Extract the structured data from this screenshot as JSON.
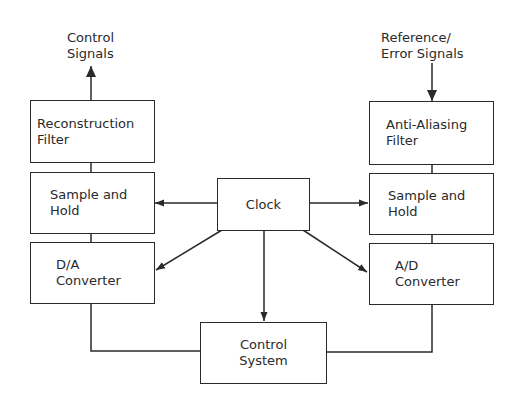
{
  "diagram": {
    "type": "block-diagram",
    "colors": {
      "line": "#2a2a2a",
      "background": "#ffffff"
    },
    "external_labels": {
      "output": {
        "line1": "Control",
        "line2": "Signals"
      },
      "input": {
        "line1": "Reference/",
        "line2": "Error Signals"
      }
    },
    "blocks": {
      "reconstruction_filter": {
        "line1": "Reconstruction",
        "line2": "Filter"
      },
      "sample_hold_left": {
        "line1": "Sample and",
        "line2": "Hold"
      },
      "da_converter": {
        "line1": "D/A",
        "line2": "Converter"
      },
      "clock": {
        "line1": "Clock"
      },
      "anti_aliasing_filter": {
        "line1": "Anti-Aliasing",
        "line2": "Filter"
      },
      "sample_hold_right": {
        "line1": "Sample and",
        "line2": "Hold"
      },
      "ad_converter": {
        "line1": "A/D",
        "line2": "Converter"
      },
      "control_system": {
        "line1": "Control",
        "line2": "System"
      }
    },
    "connections": [
      {
        "from": "reconstruction_filter",
        "to": "Control Signals",
        "arrow": true
      },
      {
        "from": "Reference/Error Signals",
        "to": "anti_aliasing_filter",
        "arrow": true
      },
      {
        "from": "reconstruction_filter",
        "to": "sample_hold_left",
        "arrow": false
      },
      {
        "from": "sample_hold_left",
        "to": "da_converter",
        "arrow": false
      },
      {
        "from": "anti_aliasing_filter",
        "to": "sample_hold_right",
        "arrow": false
      },
      {
        "from": "sample_hold_right",
        "to": "ad_converter",
        "arrow": false
      },
      {
        "from": "clock",
        "to": "sample_hold_left",
        "arrow": true
      },
      {
        "from": "clock",
        "to": "sample_hold_right",
        "arrow": true
      },
      {
        "from": "clock",
        "to": "da_converter",
        "arrow": true
      },
      {
        "from": "clock",
        "to": "ad_converter",
        "arrow": true
      },
      {
        "from": "clock",
        "to": "control_system",
        "arrow": true
      },
      {
        "from": "da_converter",
        "to": "control_system",
        "arrow": false
      },
      {
        "from": "ad_converter",
        "to": "control_system",
        "arrow": false
      }
    ]
  }
}
